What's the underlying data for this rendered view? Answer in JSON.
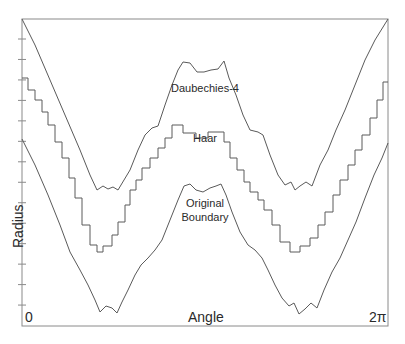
{
  "chart_data": {
    "type": "line",
    "title": "",
    "xlabel": "Angle",
    "ylabel": "Radius",
    "x_tick_labels": [
      "0",
      "2π"
    ],
    "xlim": [
      "0",
      "2π"
    ],
    "grid": false,
    "legend": "inline labels on curves",
    "y_ticks_count": 15,
    "series": [
      {
        "name": "Daubechies-4",
        "style": "smooth-wavy",
        "points_px": [
          [
            22,
            19
          ],
          [
            35,
            45
          ],
          [
            50,
            80
          ],
          [
            65,
            115
          ],
          [
            80,
            150
          ],
          [
            90,
            175
          ],
          [
            97,
            190
          ],
          [
            103,
            186
          ],
          [
            108,
            189
          ],
          [
            113,
            187
          ],
          [
            118,
            190
          ],
          [
            124,
            180
          ],
          [
            130,
            170
          ],
          [
            138,
            150
          ],
          [
            145,
            135
          ],
          [
            152,
            128
          ],
          [
            158,
            126
          ],
          [
            165,
            105
          ],
          [
            172,
            85
          ],
          [
            178,
            70
          ],
          [
            183,
            62
          ],
          [
            190,
            63
          ],
          [
            197,
            72
          ],
          [
            204,
            72
          ],
          [
            211,
            70
          ],
          [
            218,
            69
          ],
          [
            224,
            61
          ],
          [
            229,
            78
          ],
          [
            236,
            95
          ],
          [
            243,
            115
          ],
          [
            250,
            130
          ],
          [
            258,
            132
          ],
          [
            263,
            135
          ],
          [
            270,
            155
          ],
          [
            278,
            175
          ],
          [
            285,
            185
          ],
          [
            291,
            182
          ],
          [
            295,
            190
          ],
          [
            300,
            186
          ],
          [
            306,
            182
          ],
          [
            312,
            186
          ],
          [
            320,
            165
          ],
          [
            328,
            150
          ],
          [
            336,
            130
          ],
          [
            345,
            110
          ],
          [
            355,
            85
          ],
          [
            365,
            60
          ],
          [
            375,
            40
          ],
          [
            388,
            19
          ]
        ]
      },
      {
        "name": "Haar",
        "style": "stairstep",
        "points_px": [
          [
            22,
            78
          ],
          [
            28,
            78
          ],
          [
            28,
            90
          ],
          [
            35,
            90
          ],
          [
            35,
            100
          ],
          [
            42,
            100
          ],
          [
            42,
            112
          ],
          [
            48,
            112
          ],
          [
            48,
            125
          ],
          [
            55,
            125
          ],
          [
            55,
            142
          ],
          [
            62,
            142
          ],
          [
            62,
            158
          ],
          [
            69,
            158
          ],
          [
            69,
            178
          ],
          [
            75,
            178
          ],
          [
            75,
            198
          ],
          [
            82,
            198
          ],
          [
            82,
            225
          ],
          [
            90,
            225
          ],
          [
            90,
            245
          ],
          [
            97,
            245
          ],
          [
            97,
            252
          ],
          [
            103,
            252
          ],
          [
            103,
            246
          ],
          [
            112,
            246
          ],
          [
            112,
            235
          ],
          [
            118,
            235
          ],
          [
            118,
            222
          ],
          [
            125,
            222
          ],
          [
            125,
            205
          ],
          [
            130,
            205
          ],
          [
            130,
            190
          ],
          [
            136,
            190
          ],
          [
            136,
            180
          ],
          [
            142,
            180
          ],
          [
            142,
            168
          ],
          [
            150,
            168
          ],
          [
            150,
            158
          ],
          [
            158,
            158
          ],
          [
            158,
            148
          ],
          [
            165,
            148
          ],
          [
            165,
            138
          ],
          [
            172,
            138
          ],
          [
            172,
            125
          ],
          [
            183,
            125
          ],
          [
            183,
            133
          ],
          [
            196,
            133
          ],
          [
            196,
            138
          ],
          [
            208,
            138
          ],
          [
            208,
            132
          ],
          [
            224,
            132
          ],
          [
            224,
            142
          ],
          [
            230,
            142
          ],
          [
            230,
            158
          ],
          [
            237,
            158
          ],
          [
            237,
            170
          ],
          [
            244,
            170
          ],
          [
            244,
            182
          ],
          [
            250,
            182
          ],
          [
            250,
            192
          ],
          [
            258,
            192
          ],
          [
            258,
            200
          ],
          [
            264,
            200
          ],
          [
            264,
            210
          ],
          [
            272,
            210
          ],
          [
            272,
            225
          ],
          [
            280,
            225
          ],
          [
            280,
            242
          ],
          [
            290,
            242
          ],
          [
            290,
            252
          ],
          [
            300,
            252
          ],
          [
            300,
            246
          ],
          [
            310,
            246
          ],
          [
            310,
            238
          ],
          [
            318,
            238
          ],
          [
            318,
            225
          ],
          [
            325,
            225
          ],
          [
            325,
            212
          ],
          [
            333,
            212
          ],
          [
            333,
            195
          ],
          [
            340,
            195
          ],
          [
            340,
            180
          ],
          [
            348,
            180
          ],
          [
            348,
            165
          ],
          [
            355,
            165
          ],
          [
            355,
            150
          ],
          [
            362,
            150
          ],
          [
            362,
            135
          ],
          [
            370,
            135
          ],
          [
            370,
            118
          ],
          [
            377,
            118
          ],
          [
            377,
            100
          ],
          [
            383,
            100
          ],
          [
            383,
            82
          ],
          [
            388,
            82
          ]
        ]
      },
      {
        "name": "Original Boundary",
        "style": "smooth-wavy",
        "points_px": [
          [
            22,
            139
          ],
          [
            35,
            165
          ],
          [
            48,
            195
          ],
          [
            60,
            225
          ],
          [
            70,
            252
          ],
          [
            80,
            270
          ],
          [
            88,
            285
          ],
          [
            95,
            300
          ],
          [
            100,
            312
          ],
          [
            106,
            306
          ],
          [
            112,
            308
          ],
          [
            117,
            313
          ],
          [
            122,
            302
          ],
          [
            128,
            290
          ],
          [
            135,
            275
          ],
          [
            141,
            265
          ],
          [
            148,
            258
          ],
          [
            155,
            250
          ],
          [
            162,
            240
          ],
          [
            170,
            220
          ],
          [
            178,
            200
          ],
          [
            184,
            186
          ],
          [
            190,
            184
          ],
          [
            196,
            190
          ],
          [
            203,
            192
          ],
          [
            210,
            188
          ],
          [
            216,
            186
          ],
          [
            221,
            184
          ],
          [
            226,
            195
          ],
          [
            232,
            212
          ],
          [
            240,
            232
          ],
          [
            248,
            245
          ],
          [
            255,
            250
          ],
          [
            262,
            258
          ],
          [
            268,
            270
          ],
          [
            275,
            285
          ],
          [
            282,
            298
          ],
          [
            289,
            306
          ],
          [
            294,
            303
          ],
          [
            299,
            314
          ],
          [
            305,
            309
          ],
          [
            311,
            303
          ],
          [
            317,
            308
          ],
          [
            324,
            290
          ],
          [
            332,
            272
          ],
          [
            340,
            258
          ],
          [
            348,
            240
          ],
          [
            356,
            222
          ],
          [
            365,
            198
          ],
          [
            374,
            175
          ],
          [
            382,
            158
          ],
          [
            388,
            143
          ]
        ]
      }
    ],
    "annotations": [
      "Daubechies-4",
      "Haar",
      "Original Boundary"
    ]
  },
  "labels": {
    "xlabel": "Angle",
    "ylabel": "Radius",
    "x_start": "0",
    "x_end": "2π",
    "curve_d4": "Daubechies-4",
    "curve_haar": "Haar",
    "curve_orig_line1": "Original",
    "curve_orig_line2": "Boundary"
  },
  "colors": {
    "line": "#5a5a5a",
    "frame": "#7a7a7a",
    "text": "#2a2a2a"
  }
}
